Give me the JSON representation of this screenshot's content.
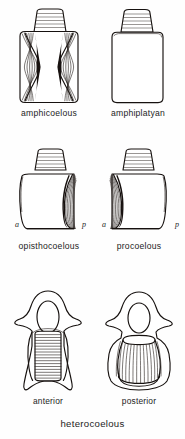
{
  "plate": {
    "title": "Vertebral centrum types",
    "background_color": "#fefefe",
    "ink_color": "#16110f"
  },
  "rows": [
    {
      "row_name": "row-one",
      "figures": [
        {
          "id": "amphicoelous",
          "label": "amphicoelous",
          "description": "Centrum concave at both anterior and posterior ends; hourglass shape in lateral view with hatched concavities on both sides.",
          "hatch_left": true,
          "hatch_right": true,
          "axis_marks": []
        },
        {
          "id": "amphiplatyan",
          "label": "amphiplatyan",
          "description": "Centrum flat at both ends; rectangular block in lateral view with no hatched concavity.",
          "hatch_left": false,
          "hatch_right": false,
          "axis_marks": []
        }
      ]
    },
    {
      "row_name": "row-two",
      "figures": [
        {
          "id": "opisthocoelous",
          "label": "opisthocoelous",
          "description": "Centrum convex anteriorly and concave posteriorly; hatched concavity on the posterior (right) face.",
          "hatch_left": false,
          "hatch_right": true,
          "axis_marks": [
            {
              "mark": "a",
              "meaning": "anterior",
              "side": "left"
            },
            {
              "mark": "p",
              "meaning": "posterior",
              "side": "right"
            }
          ]
        },
        {
          "id": "procoelous",
          "label": "procoelous",
          "description": "Centrum concave anteriorly and convex posteriorly; hatched concavity on the anterior (left) face.",
          "hatch_left": true,
          "hatch_right": false,
          "axis_marks": [
            {
              "mark": "a",
              "meaning": "anterior",
              "side": "left"
            },
            {
              "mark": "p",
              "meaning": "posterior",
              "side": "right"
            }
          ]
        }
      ]
    },
    {
      "row_name": "row-three",
      "group_label": "heterocoelous",
      "figures": [
        {
          "id": "heterocoelous-anterior",
          "label": "anterior",
          "description": "Saddle-shaped centrum seen from the front; neural canal oval above, centrum body below with horizontal hatching.",
          "hatch_direction": "horizontal",
          "axis_marks": []
        },
        {
          "id": "heterocoelous-posterior",
          "label": "posterior",
          "description": "Saddle-shaped centrum seen from behind; neural canal oval above, centrum body below with vertical hatching.",
          "hatch_direction": "vertical",
          "axis_marks": []
        }
      ]
    }
  ]
}
